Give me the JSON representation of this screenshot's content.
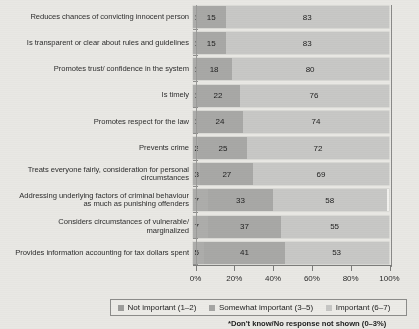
{
  "chart_data": {
    "type": "bar",
    "subtype": "horizontal-100-percent-stacked",
    "title": "",
    "xlabel": "",
    "ylabel": "",
    "xlim": [
      0,
      100
    ],
    "grid": false,
    "legend_position": "bottom",
    "categories": [
      "Reduces chances of convicting innocent person",
      "Is transparent or clear about rules and guidelines",
      "Promotes trust/ confidence in the system",
      "Is timely",
      "Promotes respect for the law",
      "Prevents crime",
      "Treats everyone fairly, consideration for personal circumstances",
      "Addressing underlying factors of criminal behaviour as much as punishing offenders",
      "Considers circumstances of vulnerable/ marginalized",
      "Provides information accounting for tax dollars spent"
    ],
    "category_lines": [
      [
        "Reduces chances of convicting innocent person"
      ],
      [
        "Is transparent or clear about rules and guidelines"
      ],
      [
        "Promotes trust/ confidence in the system"
      ],
      [
        "Is timely"
      ],
      [
        "Promotes respect for the law"
      ],
      [
        "Prevents crime"
      ],
      [
        "Treats everyone fairly, consideration for personal",
        "circumstances"
      ],
      [
        "Addressing underlying factors of criminal behaviour",
        "as much as punishing offenders"
      ],
      [
        "Considers circumstances of vulnerable/",
        "marginalized"
      ],
      [
        "Provides information accounting for tax dollars spent"
      ]
    ],
    "series": [
      {
        "name": "Not important (1–2)",
        "color": "#adadab",
        "values": [
          1,
          1,
          1,
          1,
          1,
          2,
          3,
          7,
          7,
          5
        ]
      },
      {
        "name": "Somewhat important (3–5)",
        "color": "#a8a8a6",
        "values": [
          15,
          15,
          18,
          22,
          24,
          25,
          27,
          33,
          37,
          41
        ]
      },
      {
        "name": "Important (6–7)",
        "color": "#c8c8c6",
        "values": [
          83,
          83,
          80,
          76,
          74,
          72,
          69,
          58,
          55,
          53
        ]
      }
    ],
    "xticks": [
      "0%",
      "20%",
      "40%",
      "60%",
      "80%",
      "100%"
    ],
    "xtick_values": [
      0,
      20,
      40,
      60,
      80,
      100
    ],
    "footnote": "*Don't know/No response not shown (0–3%)"
  },
  "legend": {
    "items": [
      {
        "label": "Not important (1–2)",
        "color": "#9d9d9b"
      },
      {
        "label": "Somewhat important (3–5)",
        "color": "#a5a5a3"
      },
      {
        "label": "Important (6–7)",
        "color": "#c6c6c4"
      }
    ]
  },
  "colors": {
    "background": "#e9e8e4",
    "bar_track": "#f2f1ee",
    "axis": "#7c7c7a",
    "text": "#2b2b2b"
  }
}
